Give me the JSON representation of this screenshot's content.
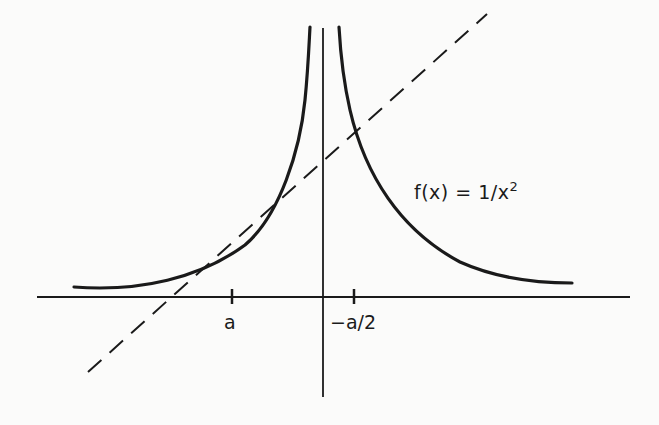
{
  "figure": {
    "function_label_prefix": "f(x) = 1/x",
    "function_label_exponent": "2",
    "tick_labels": {
      "a": "a",
      "minus_a_half": "−a/2"
    },
    "elements": [
      {
        "name": "x-axis",
        "type": "line",
        "style": "solid"
      },
      {
        "name": "y-axis",
        "type": "line",
        "style": "solid"
      },
      {
        "name": "curve-left-branch",
        "type": "curve",
        "description": "y = 1/x^2 for x < 0"
      },
      {
        "name": "curve-right-branch",
        "type": "curve",
        "description": "y = 1/x^2 for x > 0"
      },
      {
        "name": "tangent-line",
        "type": "line",
        "style": "dashed",
        "description": "tangent to curve at x = a, crossing x-axis at -a/2 side"
      }
    ],
    "colors": {
      "ink": "#1a1a1a",
      "background": "#fbfbfa"
    }
  }
}
